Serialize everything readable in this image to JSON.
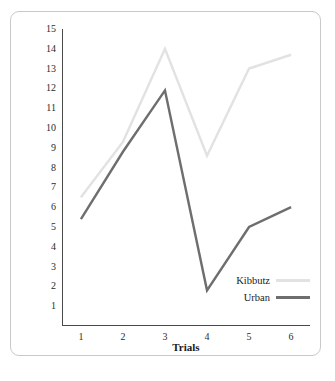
{
  "chart_data": {
    "type": "line",
    "title": "",
    "xlabel": "Trials",
    "ylabel": "Average number of circles crossed per trial",
    "x": [
      1,
      2,
      3,
      4,
      5,
      6
    ],
    "xticklabels": [
      "1",
      "2",
      "3",
      "4",
      "5",
      "6"
    ],
    "yticklabels": [
      "1",
      "2",
      "3",
      "4",
      "5",
      "6",
      "7",
      "8",
      "9",
      "10",
      "11",
      "12",
      "13",
      "14",
      "15"
    ],
    "yticks": [
      1,
      2,
      3,
      4,
      5,
      6,
      7,
      8,
      9,
      10,
      11,
      12,
      13,
      14,
      15
    ],
    "xlim": [
      0.55,
      6.45
    ],
    "ylim": [
      0,
      15
    ],
    "grid": false,
    "legend_position": "lower-right-inside",
    "series": [
      {
        "name": "Kibbutz",
        "color": "#e2e2e2",
        "values": [
          6.5,
          9.3,
          14.0,
          8.6,
          13.0,
          13.7
        ]
      },
      {
        "name": "Urban",
        "color": "#6e6e6e",
        "values": [
          5.4,
          8.8,
          11.9,
          1.8,
          5.0,
          6.0
        ]
      }
    ]
  },
  "legend": {
    "items": [
      {
        "label": "Kibbutz"
      },
      {
        "label": "Urban"
      }
    ]
  },
  "caption": {
    "text": ""
  },
  "colors": {
    "axis": "#4a4a4a",
    "frame": "#c9c9c9",
    "kibbutz": "#e2e2e2",
    "urban": "#6e6e6e",
    "background": "#ffffff"
  }
}
